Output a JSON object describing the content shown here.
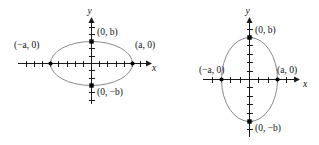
{
  "figure": {
    "background_color": "#ffffff",
    "axis_color": "#1a1a1a",
    "curve_color": "#8a8a8a",
    "point_color": "#000000",
    "panels": [
      {
        "id": "horizontal-ellipse",
        "orientation": "horizontal",
        "description": "Ellipse with horizontal major axis, a greater than b",
        "center": {
          "x": 91.5,
          "y": 63.5
        },
        "semi_axis_x_px": 41,
        "semi_axis_y_px": 22,
        "x_axis": {
          "start_x": 18,
          "end_x": 148,
          "y": 63.5,
          "label": "x",
          "label_x": 152,
          "label_y": 71
        },
        "y_axis": {
          "start_y": 17,
          "end_y": 104,
          "x": 91.5,
          "label": "y",
          "label_x": 88,
          "label_y": 14
        },
        "x_ticks": [
          -6,
          -5,
          -4,
          -3,
          -2,
          -1,
          1,
          2,
          3,
          4,
          5,
          6
        ],
        "y_ticks": [
          -3,
          -2,
          -1,
          1,
          2,
          3
        ],
        "tick_spacing_x_px": 8.2,
        "tick_spacing_y_px": 7.3,
        "tick_half_len_px": 3,
        "vertices": [
          {
            "name": "left-vertex",
            "label": "(-a, 0)",
            "label_plain": "(−a, 0)",
            "cx": 50.5,
            "cy": 63.5,
            "label_x": 14,
            "label_y": 48
          },
          {
            "name": "right-vertex",
            "label": "(a, 0)",
            "cx": 132.5,
            "cy": 63.5,
            "label_x": 135,
            "label_y": 48
          },
          {
            "name": "top-covertex",
            "label": "(0, b)",
            "cx": 91.5,
            "cy": 41.5,
            "label_x": 97,
            "label_y": 35
          },
          {
            "name": "bottom-covertex",
            "label": "(0, -b)",
            "label_plain": "(0, −b)",
            "cx": 91.5,
            "cy": 85.5,
            "label_x": 97,
            "label_y": 95
          }
        ]
      },
      {
        "id": "vertical-ellipse",
        "orientation": "vertical",
        "description": "Ellipse with vertical major axis, b greater than a",
        "center": {
          "x": 249.5,
          "y": 79.5
        },
        "semi_axis_x_px": 28,
        "semi_axis_y_px": 42,
        "x_axis": {
          "start_x": 203,
          "end_x": 300,
          "y": 79.5,
          "label": "x",
          "label_x": 304,
          "label_y": 87
        },
        "y_axis": {
          "start_y": 17,
          "end_y": 135,
          "x": 249.5,
          "label": "y",
          "label_x": 246,
          "label_y": 14
        },
        "x_ticks": [
          -5,
          -4,
          -3,
          -2,
          -1,
          1,
          2,
          3,
          4,
          5
        ],
        "y_ticks": [
          -5,
          -4,
          -3,
          -2,
          -1,
          1,
          2,
          3,
          4,
          5
        ],
        "tick_spacing_x_px": 9.3,
        "tick_spacing_y_px": 8.4,
        "tick_half_len_px": 3,
        "vertices": [
          {
            "name": "left-covertex",
            "label": "(-a, 0)",
            "label_plain": "(−a, 0)",
            "cx": 221.5,
            "cy": 79.5,
            "label_x": 199,
            "label_y": 73
          },
          {
            "name": "right-covertex",
            "label": "(a, 0)",
            "cx": 277.5,
            "cy": 79.5,
            "label_x": 277,
            "label_y": 73
          },
          {
            "name": "top-vertex",
            "label": "(0, b)",
            "cx": 249.5,
            "cy": 37.5,
            "label_x": 255,
            "label_y": 33
          },
          {
            "name": "bottom-vertex",
            "label": "(0, -b)",
            "label_plain": "(0, −b)",
            "cx": 249.5,
            "cy": 121.5,
            "label_x": 255,
            "label_y": 131
          }
        ]
      }
    ]
  }
}
